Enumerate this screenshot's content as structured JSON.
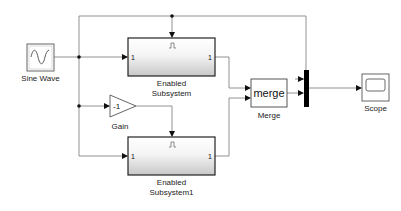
{
  "diagram": {
    "type": "simulink-model",
    "blocks": [
      {
        "id": "sine",
        "label": "Sine Wave",
        "icon": "sine-wave-icon"
      },
      {
        "id": "enabled1",
        "label_line1": "Enabled",
        "label_line2": "Subsystem",
        "in_port": "1",
        "out_port": "1",
        "enable_glyph": "⎍"
      },
      {
        "id": "gain",
        "label": "Gain",
        "value": "-1"
      },
      {
        "id": "enabled2",
        "label_line1": "Enabled",
        "label_line2": "Subsystem1",
        "in_port": "1",
        "out_port": "1",
        "enable_glyph": "⎍"
      },
      {
        "id": "merge",
        "label": "Merge",
        "text": "merge"
      },
      {
        "id": "mux",
        "label": ""
      },
      {
        "id": "scope",
        "label": "Scope",
        "icon": "scope-icon"
      }
    ],
    "connections": [
      {
        "from": "Sine Wave",
        "to": "Enabled Subsystem.in1"
      },
      {
        "from": "Sine Wave",
        "to": "Enabled Subsystem.enable"
      },
      {
        "from": "Sine Wave",
        "to": "Gain"
      },
      {
        "from": "Gain",
        "to": "Enabled Subsystem1.enable"
      },
      {
        "from": "Sine Wave",
        "to": "Enabled Subsystem1.in1"
      },
      {
        "from": "Enabled Subsystem",
        "to": "Merge.in1"
      },
      {
        "from": "Enabled Subsystem1",
        "to": "Merge.in2"
      },
      {
        "from": "Sine Wave",
        "to": "Mux.in1"
      },
      {
        "from": "Merge",
        "to": "Mux.in2"
      },
      {
        "from": "Mux",
        "to": "Scope"
      }
    ]
  }
}
